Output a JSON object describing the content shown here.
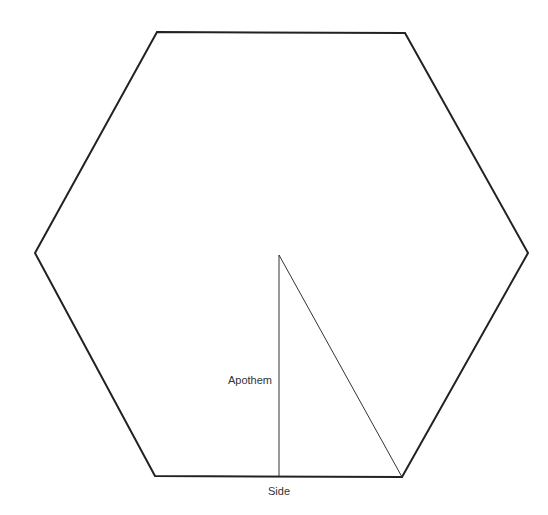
{
  "diagram": {
    "colors": {
      "background": "#ffffff",
      "outline": "#222222",
      "inner_lines": "#333333",
      "text": "#333333"
    },
    "hexagon": {
      "vertices": [
        [
          157,
          32
        ],
        [
          405,
          33
        ],
        [
          528,
          253
        ],
        [
          402,
          477
        ],
        [
          155,
          476
        ],
        [
          35,
          253
        ]
      ]
    },
    "center": [
      279,
      255
    ],
    "apothem": {
      "label": "Apothem",
      "from": [
        279,
        255
      ],
      "to": [
        279,
        476
      ]
    },
    "radius_line": {
      "from": [
        279,
        255
      ],
      "to": [
        402,
        477
      ]
    },
    "labels": {
      "apothem": "Apothem",
      "side": "Side"
    }
  }
}
